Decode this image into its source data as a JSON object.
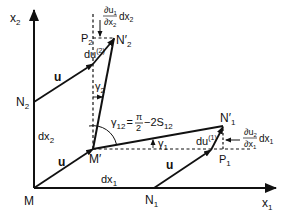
{
  "figure": {
    "colors": {
      "ink": "#111111",
      "background": "#ffffff"
    },
    "axes": {
      "x1_label": "x",
      "x1_sub": "1",
      "x2_label": "x",
      "x2_sub": "2"
    },
    "points": {
      "M": "M",
      "M_prime": "M′",
      "N1": "N",
      "N1_sub": "1",
      "N1_prime": "N′",
      "N1_prime_sub": "1",
      "N2": "N",
      "N2_sub": "2",
      "N2_prime": "N′",
      "N2_prime_sub": "2",
      "P1": "P",
      "P1_sub": "1",
      "P2": "P",
      "P2_sub": "2"
    },
    "vectors": {
      "u": "u",
      "du1": "du",
      "du1_sup": "(1)",
      "du2": "du",
      "du2_sup": "(2)"
    },
    "lengths": {
      "dx1": "dx",
      "dx1_sub": "1",
      "dx2": "dx",
      "dx2_sub": "2"
    },
    "angles": {
      "gamma1": "γ",
      "gamma1_sub": "1",
      "gamma2": "γ",
      "gamma2_sub": "2",
      "gamma12": "γ",
      "gamma12_sub": "12",
      "gamma12_eq": "=",
      "pi": "π",
      "two": "2",
      "minus_2S": "−2S",
      "S_sub": "12"
    },
    "gradients": {
      "du1_dx2_num": "∂u",
      "du1_dx2_num_sub": "1",
      "du1_dx2_den": "∂x",
      "du1_dx2_den_sub": "2",
      "du1_dx2_factor": "dx",
      "du1_dx2_factor_sub": "2",
      "du2_dx1_num": "∂u",
      "du2_dx1_num_sub": "2",
      "du2_dx1_den": "∂x",
      "du2_dx1_den_sub": "1",
      "du2_dx1_factor": "dx",
      "du2_dx1_factor_sub": "1"
    }
  }
}
